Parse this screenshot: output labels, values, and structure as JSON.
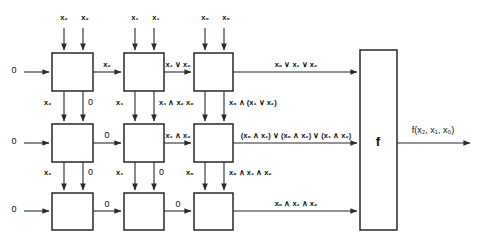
{
  "diagram": {
    "colors": {
      "stroke": "#1a1a1a",
      "wire": "#2b2b2b",
      "background": "#ffffff",
      "text": "#111111"
    },
    "left_inputs": [
      {
        "label": "0",
        "row": 1
      },
      {
        "label": "0",
        "row": 2
      },
      {
        "label": "0",
        "row": 3
      }
    ],
    "top_inputs": [
      {
        "left": "x₂",
        "right": "x₂",
        "column": 1
      },
      {
        "left": "x₁",
        "right": "x₁",
        "column": 2
      },
      {
        "left": "x₀",
        "right": "x₀",
        "column": 3
      }
    ],
    "horizontal_labels": {
      "row1": [
        "x₂",
        "x₁ ∨ x₂",
        "x₀ ∨ x₁ ∨ x₂"
      ],
      "row2": [
        "0",
        "x₁ ∧ x₂",
        "(x₀ ∧ x₁) ∨ (x₀ ∧ x₂) ∨ (x₁ ∧ x₂)"
      ],
      "row3": [
        "0",
        "0",
        "x₀ ∧ x₁ ∧ x₂"
      ]
    },
    "vertical_labels": {
      "row1_to_row2": [
        {
          "left": "x₂",
          "right": "0"
        },
        {
          "left": "x₁",
          "right": "x₁ ∧ x₂"
        },
        {
          "left": "x₀",
          "right": "x₀ ∧ (x₁ ∨ x₂)"
        }
      ],
      "row2_to_row3": [
        {
          "left": "x₂",
          "right": "0"
        },
        {
          "left": "x₁",
          "right": "0"
        },
        {
          "left": "x₀",
          "right": "x₀ ∧ x₁ ∧ x₂"
        }
      ]
    },
    "f_block": {
      "symbol": "f",
      "output": "f(x₂, x₁, x₀)"
    }
  }
}
